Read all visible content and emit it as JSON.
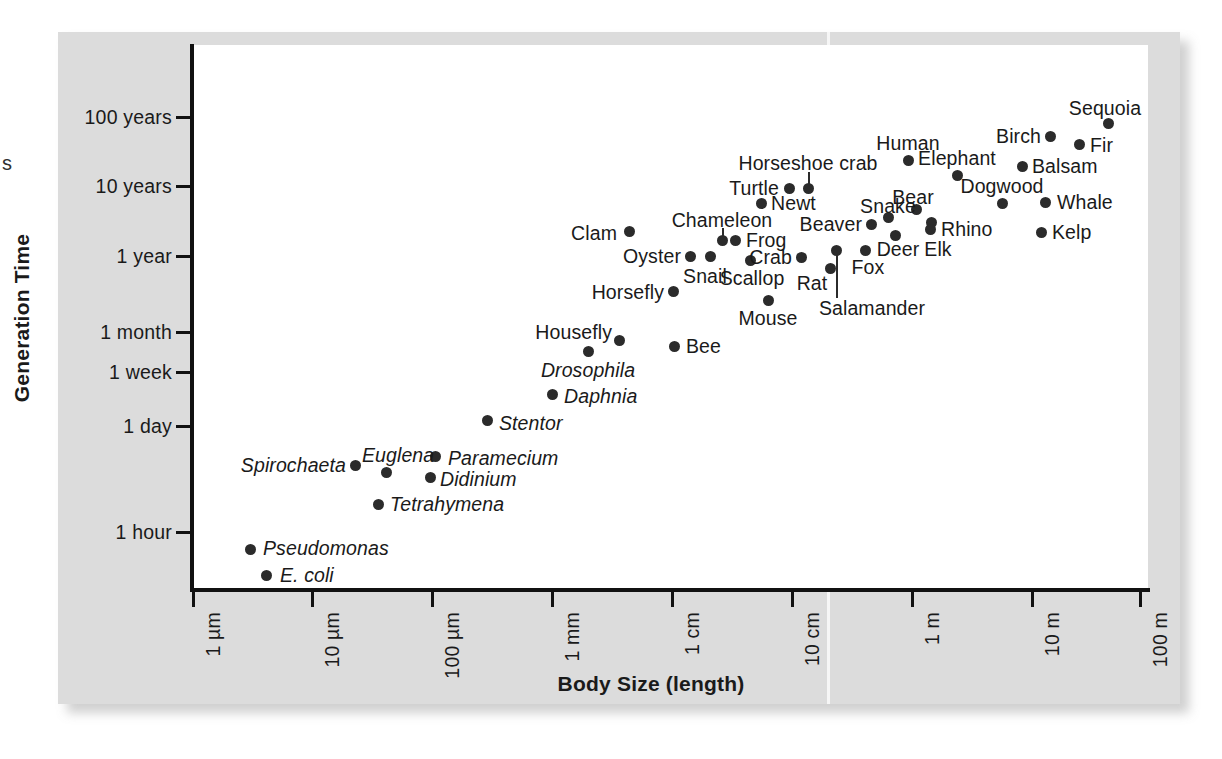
{
  "page": {
    "bleed_fragment": "s",
    "background_color": "#ffffff",
    "panel_color": "#dcdcdc",
    "plot_color": "#ffffff",
    "marker_color": "#2b2b2b",
    "text_color": "#1a1a1a"
  },
  "chart_data": {
    "type": "scatter",
    "title": "",
    "xlabel": "Body Size (length)",
    "ylabel": "Generation Time",
    "grid": false,
    "legend": "none",
    "x_scale": "log",
    "y_scale": "log",
    "x_tick_labels": [
      "1 µm",
      "10 µm",
      "100 µm",
      "1 mm",
      "1 cm",
      "10 cm",
      "1 m",
      "10 m",
      "100 m"
    ],
    "y_tick_labels": [
      "100 years",
      "10 years",
      "1 year",
      "1 month",
      "1 week",
      "1 day",
      "1 hour"
    ],
    "points": [
      {
        "name": "E. coli",
        "italic": true,
        "x": 266,
        "y": 575,
        "label_x": 280,
        "label_y": 575,
        "align": "left"
      },
      {
        "name": "Pseudomonas",
        "italic": true,
        "x": 250,
        "y": 549,
        "label_x": 263,
        "label_y": 548,
        "align": "left"
      },
      {
        "name": "Tetrahymena",
        "italic": true,
        "x": 378,
        "y": 504,
        "label_x": 390,
        "label_y": 504,
        "align": "left"
      },
      {
        "name": "Spirochaeta",
        "italic": true,
        "x": 355,
        "y": 465,
        "label_x": 346,
        "label_y": 465,
        "align": "right"
      },
      {
        "name": "Euglena",
        "italic": true,
        "x": 386,
        "y": 472,
        "label_x": 362,
        "label_y": 455,
        "align": "left"
      },
      {
        "name": "Didinium",
        "italic": true,
        "x": 430,
        "y": 477,
        "label_x": 440,
        "label_y": 479,
        "align": "left"
      },
      {
        "name": "Paramecium",
        "italic": true,
        "x": 435,
        "y": 456,
        "label_x": 448,
        "label_y": 458,
        "align": "left"
      },
      {
        "name": "Stentor",
        "italic": true,
        "x": 487,
        "y": 420,
        "label_x": 499,
        "label_y": 423,
        "align": "left"
      },
      {
        "name": "Daphnia",
        "italic": true,
        "x": 552,
        "y": 394,
        "label_x": 564,
        "label_y": 396,
        "align": "left"
      },
      {
        "name": "Drosophila",
        "italic": true,
        "x": 588,
        "y": 351,
        "label_x": 588,
        "label_y": 370,
        "align": "center"
      },
      {
        "name": "Housefly",
        "italic": false,
        "x": 619,
        "y": 340,
        "label_x": 612,
        "label_y": 332,
        "align": "right"
      },
      {
        "name": "Bee",
        "italic": false,
        "x": 674,
        "y": 346,
        "label_x": 686,
        "label_y": 346,
        "align": "left"
      },
      {
        "name": "Horsefly",
        "italic": false,
        "x": 673,
        "y": 291,
        "label_x": 664,
        "label_y": 292,
        "align": "right"
      },
      {
        "name": "Mouse",
        "italic": false,
        "x": 768,
        "y": 300,
        "label_x": 768,
        "label_y": 318,
        "align": "center"
      },
      {
        "name": "Clam",
        "italic": false,
        "x": 629,
        "y": 231,
        "label_x": 617,
        "label_y": 233,
        "align": "right"
      },
      {
        "name": "Oyster",
        "italic": false,
        "x": 690,
        "y": 256,
        "label_x": 681,
        "label_y": 256,
        "align": "right"
      },
      {
        "name": "Snail",
        "italic": false,
        "x": 710,
        "y": 256,
        "label_x": 705,
        "label_y": 276,
        "align": "center"
      },
      {
        "name": "Chameleon",
        "italic": false,
        "x": 722,
        "y": 240,
        "label_x": 722,
        "label_y": 220,
        "align": "center"
      },
      {
        "name": "Frog",
        "italic": false,
        "x": 735,
        "y": 240,
        "label_x": 746,
        "label_y": 240,
        "align": "left"
      },
      {
        "name": "Scallop",
        "italic": false,
        "x": 750,
        "y": 260,
        "label_x": 752,
        "label_y": 278,
        "align": "center"
      },
      {
        "name": "Crab",
        "italic": false,
        "x": 801,
        "y": 257,
        "label_x": 792,
        "label_y": 257,
        "align": "right"
      },
      {
        "name": "Rat",
        "italic": false,
        "x": 830,
        "y": 268,
        "label_x": 812,
        "label_y": 283,
        "align": "center"
      },
      {
        "name": "Salamander",
        "italic": false,
        "x": 836,
        "y": 250,
        "label_x": 872,
        "label_y": 308,
        "align": "center"
      },
      {
        "name": "Fox",
        "italic": false,
        "x": 865,
        "y": 250,
        "label_x": 868,
        "label_y": 267,
        "align": "center"
      },
      {
        "name": "Newt",
        "italic": false,
        "x": 761,
        "y": 203,
        "label_x": 771,
        "label_y": 203,
        "align": "left"
      },
      {
        "name": "Turtle",
        "italic": false,
        "x": 789,
        "y": 188,
        "label_x": 779,
        "label_y": 188,
        "align": "right"
      },
      {
        "name": "Horseshoe crab",
        "italic": false,
        "x": 808,
        "y": 188,
        "label_x": 808,
        "label_y": 163,
        "align": "center"
      },
      {
        "name": "Beaver",
        "italic": false,
        "x": 871,
        "y": 224,
        "label_x": 862,
        "label_y": 224,
        "align": "right"
      },
      {
        "name": "Snake",
        "italic": false,
        "x": 888,
        "y": 217,
        "label_x": 888,
        "label_y": 206,
        "align": "center"
      },
      {
        "name": "Deer",
        "italic": false,
        "x": 895,
        "y": 235,
        "label_x": 898,
        "label_y": 249,
        "align": "center"
      },
      {
        "name": "Elk",
        "italic": false,
        "x": 931,
        "y": 222,
        "label_x": 938,
        "label_y": 249,
        "align": "center"
      },
      {
        "name": "Bear",
        "italic": false,
        "x": 916,
        "y": 209,
        "label_x": 913,
        "label_y": 197,
        "align": "center"
      },
      {
        "name": "Rhino",
        "italic": false,
        "x": 930,
        "y": 229,
        "label_x": 941,
        "label_y": 229,
        "align": "left"
      },
      {
        "name": "Human",
        "italic": false,
        "x": 908,
        "y": 160,
        "label_x": 908,
        "label_y": 143,
        "align": "center"
      },
      {
        "name": "Elephant",
        "italic": false,
        "x": 957,
        "y": 175,
        "label_x": 957,
        "label_y": 158,
        "align": "center"
      },
      {
        "name": "Dogwood",
        "italic": false,
        "x": 1002,
        "y": 203,
        "label_x": 1002,
        "label_y": 186,
        "align": "center"
      },
      {
        "name": "Whale",
        "italic": false,
        "x": 1045,
        "y": 202,
        "label_x": 1057,
        "label_y": 202,
        "align": "left"
      },
      {
        "name": "Kelp",
        "italic": false,
        "x": 1041,
        "y": 232,
        "label_x": 1052,
        "label_y": 232,
        "align": "left"
      },
      {
        "name": "Balsam",
        "italic": false,
        "x": 1022,
        "y": 166,
        "label_x": 1032,
        "label_y": 166,
        "align": "left"
      },
      {
        "name": "Birch",
        "italic": false,
        "x": 1050,
        "y": 136,
        "label_x": 1041,
        "label_y": 136,
        "align": "right"
      },
      {
        "name": "Fir",
        "italic": false,
        "x": 1079,
        "y": 144,
        "label_x": 1090,
        "label_y": 145,
        "align": "left"
      },
      {
        "name": "Sequoia",
        "italic": false,
        "x": 1108,
        "y": 123,
        "label_x": 1105,
        "label_y": 108,
        "align": "center"
      }
    ],
    "leaders": [
      {
        "for": "Horseshoe crab",
        "x": 808,
        "y_top": 172,
        "y_bottom": 186
      },
      {
        "for": "Chameleon",
        "x": 722,
        "y_top": 228,
        "y_bottom": 238
      },
      {
        "for": "Salamander",
        "x": 836,
        "y_top": 252,
        "y_bottom": 298
      }
    ]
  }
}
